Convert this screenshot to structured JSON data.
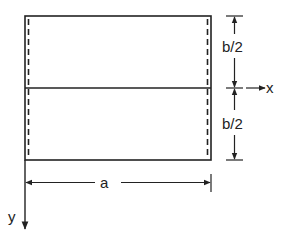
{
  "diagram": {
    "type": "plate-dimension-sketch",
    "labels": {
      "upper_half": "b/2",
      "lower_half": "b/2",
      "width": "a",
      "x_axis": "x",
      "y_axis": "y"
    },
    "colors": {
      "stroke": "#222222",
      "background": "#ffffff"
    },
    "elements": {
      "plate": {
        "left": 25,
        "top": 16,
        "right": 211,
        "bottom": 160,
        "midline_y": 88
      },
      "dashed_edges": [
        "left",
        "right"
      ],
      "x_axis_direction": "right",
      "y_axis_direction": "down"
    }
  }
}
